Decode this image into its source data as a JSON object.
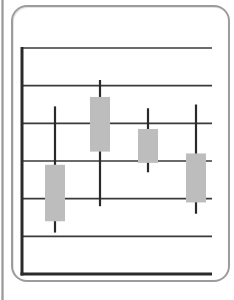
{
  "chart_data": {
    "type": "candlestick",
    "title": "",
    "xlabel": "",
    "ylabel": "",
    "categories": [
      "1",
      "2",
      "3",
      "4"
    ],
    "series": [
      {
        "name": "price",
        "open": [
          1.4,
          3.25,
          2.95,
          3.2
        ],
        "close": [
          2.9,
          4.7,
          3.85,
          1.9
        ],
        "high": [
          4.45,
          5.15,
          4.4,
          4.5
        ],
        "low": [
          1.1,
          1.8,
          2.7,
          1.6
        ]
      }
    ],
    "ylim": [
      0,
      6
    ],
    "gridlines": [
      1,
      2,
      3,
      4,
      5,
      6
    ],
    "grid": true,
    "legend": false,
    "tick_labels": false
  },
  "style": {
    "frame_color": "#9c9c9c",
    "axis_color": "#2a2a2a",
    "grid_color": "#3a3a3a",
    "body_color": "#bdbdbd",
    "wick_color": "#2a2a2a"
  }
}
